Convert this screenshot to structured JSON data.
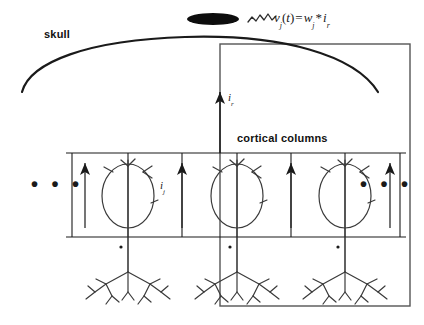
{
  "figure": {
    "labels": {
      "skull": "skull",
      "cortical_columns": "cortical columns",
      "equation": "v_j(t) = w_j * i_r",
      "equation_parts": {
        "v": "v",
        "v_sub": "j",
        "open_paren": "(",
        "t": "t",
        "close_paren": ")",
        "equals": "=",
        "w": "w",
        "w_sub": "j",
        "asterisk": "*",
        "i": "i",
        "i_sub": "r"
      },
      "radial_current": "i_r",
      "radial_current_parts": {
        "symbol": "i",
        "sub": "r"
      },
      "column_current": "i_j",
      "column_current_parts": {
        "symbol": "i",
        "sub": "j"
      },
      "ellipsis_left": "• • •",
      "ellipsis_right": "• • •"
    },
    "icons": {
      "electrode": "electrode-ellipse-icon",
      "waveform": "eeg-waveform-icon",
      "skull_arc": "skull-arc-icon",
      "neuron": "pyramidal-neuron-icon",
      "up_arrow": "up-arrow-icon",
      "synapse": "synapse-dot-icon",
      "boundary": "boundary-rectangle-icon"
    },
    "colors": {
      "stroke": "#1a1a1a",
      "thin_stroke": "#4a4a4a",
      "electrode_fill": "#0d0d0d",
      "background": "#ffffff",
      "rect_stroke": "#555555"
    },
    "geometry": {
      "canvas_width": 424,
      "canvas_height": 325,
      "boundary_rect": {
        "x": 220,
        "y": 44,
        "width": 190,
        "height": 262
      },
      "cortex_top_line_y": 153,
      "cortex_bottom_line_y": 237,
      "column_dividers_x": [
        72,
        128,
        182,
        237,
        291,
        345,
        400
      ],
      "neuron_centers_x": [
        128,
        237,
        345
      ],
      "arrow_columns_x": [
        85,
        182,
        291,
        390
      ],
      "electrode": {
        "cx": 213,
        "cy": 19,
        "rx": 26,
        "ry": 6
      }
    }
  }
}
